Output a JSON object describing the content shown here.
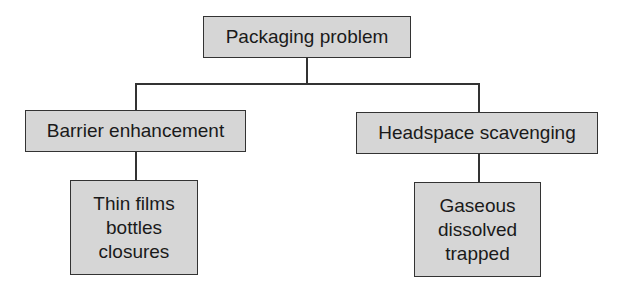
{
  "diagram": {
    "root": {
      "label": "Packaging problem"
    },
    "children": [
      {
        "label": "Barrier enhancement",
        "leaf": [
          "Thin films",
          "bottles",
          "closures"
        ]
      },
      {
        "label": "Headspace scavenging",
        "leaf": [
          "Gaseous",
          "dissolved",
          "trapped"
        ]
      }
    ]
  },
  "colors": {
    "box_fill": "#d6d6d6",
    "line": "#333333"
  }
}
